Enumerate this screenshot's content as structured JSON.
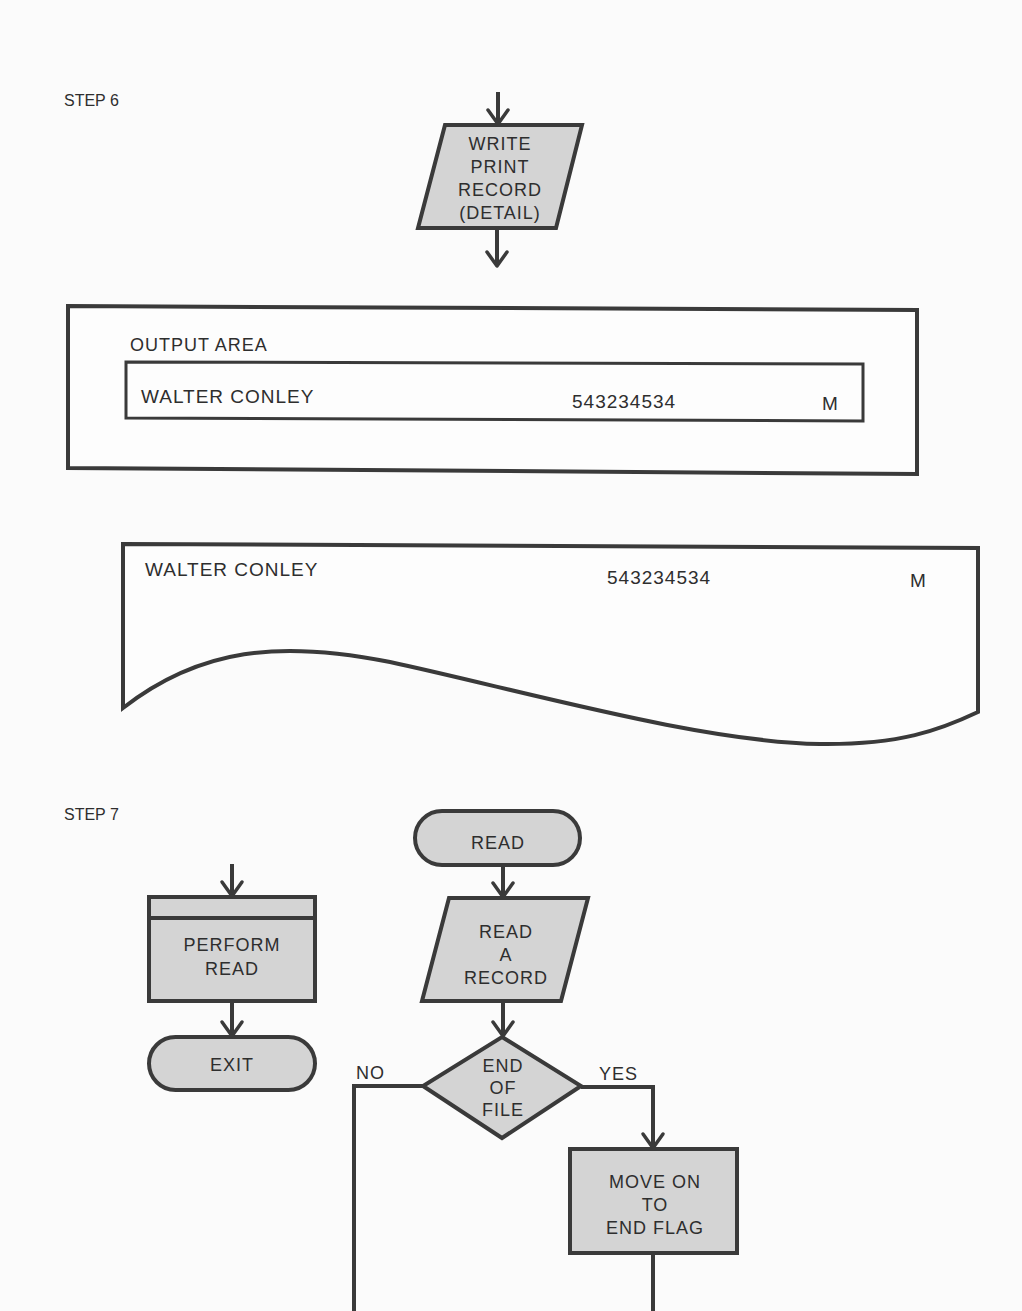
{
  "step6": {
    "label": "STEP 6",
    "write_block": {
      "lines": [
        "WRITE",
        "PRINT",
        "RECORD",
        "(DETAIL)"
      ]
    },
    "output_area": {
      "title": "OUTPUT AREA",
      "record": {
        "name": "WALTER CONLEY",
        "number": "543234534",
        "code": "M"
      }
    },
    "printed_document": {
      "name": "WALTER CONLEY",
      "number": "543234534",
      "code": "M"
    }
  },
  "step7": {
    "label": "STEP 7",
    "perform_block": {
      "lines": [
        "PERFORM",
        "READ"
      ]
    },
    "exit_terminal": {
      "label": "EXIT"
    },
    "read_terminal": {
      "label": "READ"
    },
    "read_record_block": {
      "lines": [
        "READ",
        "A",
        "RECORD"
      ]
    },
    "decision": {
      "lines": [
        "END",
        "OF",
        "FILE"
      ],
      "no_label": "NO",
      "yes_label": "YES"
    },
    "move_block": {
      "lines": [
        "MOVE ON",
        "TO",
        "END FLAG"
      ]
    }
  },
  "colors": {
    "shape_fill": "#d4d4d4",
    "stroke": "#3a3a3a",
    "background": "#fbfbfb"
  }
}
